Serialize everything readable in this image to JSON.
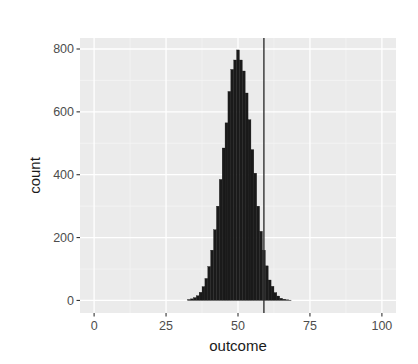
{
  "chart_data": {
    "type": "bar",
    "subtype": "histogram",
    "title": "",
    "xlabel": "outcome",
    "ylabel": "count",
    "xlim": [
      -4.9,
      104.9
    ],
    "ylim": [
      -40,
      835
    ],
    "x_ticks": [
      0,
      25,
      50,
      75,
      100
    ],
    "x_tick_labels": [
      "0",
      "25",
      "50",
      "75",
      "100"
    ],
    "y_ticks": [
      0,
      200,
      400,
      600,
      800
    ],
    "y_tick_labels": [
      "0",
      "200",
      "400",
      "600",
      "800"
    ],
    "grid": true,
    "legend": "none",
    "binwidth": 1,
    "bins": [
      {
        "x": 33,
        "count": 3
      },
      {
        "x": 34,
        "count": 5
      },
      {
        "x": 35,
        "count": 9
      },
      {
        "x": 36,
        "count": 15
      },
      {
        "x": 37,
        "count": 26
      },
      {
        "x": 38,
        "count": 44
      },
      {
        "x": 39,
        "count": 70
      },
      {
        "x": 40,
        "count": 108
      },
      {
        "x": 41,
        "count": 160
      },
      {
        "x": 42,
        "count": 225
      },
      {
        "x": 43,
        "count": 300
      },
      {
        "x": 44,
        "count": 385
      },
      {
        "x": 45,
        "count": 485
      },
      {
        "x": 46,
        "count": 565
      },
      {
        "x": 47,
        "count": 665
      },
      {
        "x": 48,
        "count": 735
      },
      {
        "x": 49,
        "count": 765
      },
      {
        "x": 50,
        "count": 797
      },
      {
        "x": 51,
        "count": 765
      },
      {
        "x": 52,
        "count": 730
      },
      {
        "x": 53,
        "count": 660
      },
      {
        "x": 54,
        "count": 575
      },
      {
        "x": 55,
        "count": 480
      },
      {
        "x": 56,
        "count": 405
      },
      {
        "x": 57,
        "count": 300
      },
      {
        "x": 58,
        "count": 220
      },
      {
        "x": 59,
        "count": 160
      },
      {
        "x": 60,
        "count": 110
      },
      {
        "x": 61,
        "count": 65
      },
      {
        "x": 62,
        "count": 45
      },
      {
        "x": 63,
        "count": 25
      },
      {
        "x": 64,
        "count": 14
      },
      {
        "x": 65,
        "count": 7
      },
      {
        "x": 66,
        "count": 4
      },
      {
        "x": 67,
        "count": 2
      },
      {
        "x": 68,
        "count": 1
      }
    ],
    "vline": {
      "x": 59,
      "color": "#333333"
    },
    "colors": {
      "panel_background": "#ebebeb",
      "grid_major": "#ffffff",
      "grid_minor": "#f5f5f5",
      "bar_fill": "#1a1a1a",
      "tick_text": "#4d4d4d",
      "axis_title": "#1a1a1a"
    }
  },
  "layout": {
    "panel": {
      "left": 80,
      "top": 38,
      "right": 396,
      "bottom": 313
    }
  }
}
